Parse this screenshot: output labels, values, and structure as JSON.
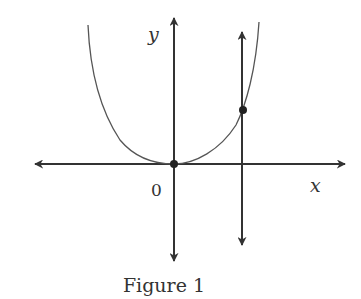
{
  "figure": {
    "caption": "Figure 1",
    "labels": {
      "y_axis": "y",
      "x_axis": "x",
      "origin": "0"
    },
    "colors": {
      "stroke": "#333333",
      "curve": "#555555",
      "background": "#ffffff"
    },
    "elements": [
      {
        "type": "axis",
        "name": "x-axis",
        "direction": "horizontal",
        "arrows": "both"
      },
      {
        "type": "axis",
        "name": "y-axis",
        "direction": "vertical",
        "arrows": "both"
      },
      {
        "type": "curve",
        "name": "parabola",
        "shape": "upward-opening U through origin"
      },
      {
        "type": "line",
        "name": "vertical-line",
        "direction": "vertical",
        "arrows": "both",
        "position": "right of y-axis"
      },
      {
        "type": "point",
        "name": "origin-point",
        "at": "origin"
      },
      {
        "type": "point",
        "name": "intersection-point",
        "at": "intersection of curve and vertical line"
      }
    ]
  }
}
